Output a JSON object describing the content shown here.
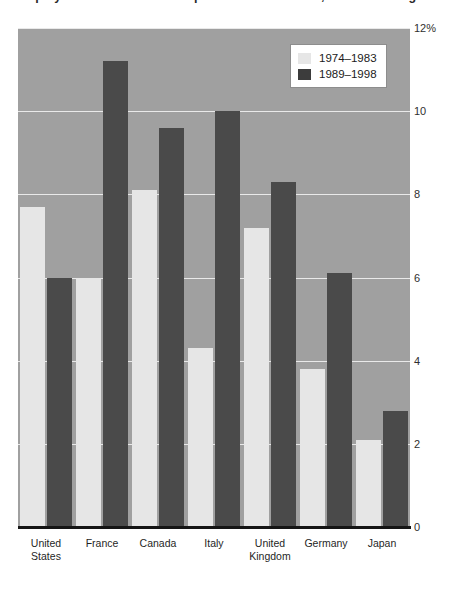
{
  "chart_data": {
    "type": "bar",
    "title": "Unemployment Rate in the Group of Seven Countries, Annual Averages 1974–1998",
    "subtitle": "",
    "xlabel": "",
    "ylabel": "",
    "ylim": [
      0,
      12
    ],
    "ytick_values": [
      12,
      10,
      8,
      6,
      4,
      2,
      0
    ],
    "ytick_labels": [
      "12%",
      "10",
      "8",
      "6",
      "4",
      "2",
      "0"
    ],
    "grid": true,
    "legend_position": "top-right",
    "categories": [
      "United States",
      "France",
      "Canada",
      "Italy",
      "United Kingdom",
      "Germany",
      "Japan"
    ],
    "series": [
      {
        "name": "1974–1983",
        "color": "#e6e6e6",
        "values": [
          7.7,
          6.0,
          8.1,
          4.3,
          7.2,
          3.8,
          2.1
        ]
      },
      {
        "name": "1989–1998",
        "color": "#4a4a4a",
        "values": [
          6.0,
          11.2,
          9.6,
          10.0,
          8.3,
          6.1,
          2.8
        ]
      }
    ],
    "plot_background": "#a0a0a0",
    "gridline_color": "#e9e9e9",
    "axis_color": "#151515"
  },
  "legend": {
    "entries": [
      {
        "label": "1974–1983"
      },
      {
        "label": "1989–1998"
      }
    ]
  },
  "yaxis": {
    "ticks": [
      {
        "label": "12%"
      },
      {
        "label": "10"
      },
      {
        "label": "8"
      },
      {
        "label": "6"
      },
      {
        "label": "4"
      },
      {
        "label": "2"
      },
      {
        "label": "0"
      }
    ]
  },
  "xaxis": {
    "ticks": [
      {
        "label": "United\nStates"
      },
      {
        "label": "France"
      },
      {
        "label": "Canada"
      },
      {
        "label": "Italy"
      },
      {
        "label": "United\nKingdom"
      },
      {
        "label": "Germany"
      },
      {
        "label": "Japan"
      }
    ]
  }
}
